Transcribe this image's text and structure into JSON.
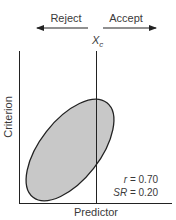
{
  "diagram": {
    "title_labels": {
      "reject": "Reject",
      "accept": "Accept",
      "cutoff_symbol": "X",
      "cutoff_subscript": "c"
    },
    "axes": {
      "x_label": "Predictor",
      "y_label": "Criterion"
    },
    "stats": {
      "r_label": "r = 0.70",
      "sr_label": "SR = 0.20"
    },
    "colors": {
      "ellipse_fill": "#c8c8c8",
      "line": "#222222",
      "text": "#3a3a3a"
    }
  }
}
